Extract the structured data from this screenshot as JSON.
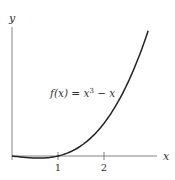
{
  "chart_data": {
    "type": "line",
    "title": "",
    "xlabel": "x",
    "ylabel": "y",
    "annotation": "f(x) = x³ − x",
    "xticks": [
      "1",
      "2"
    ],
    "xlim": [
      0,
      3.1
    ],
    "ylim": [
      -0.5,
      23
    ],
    "grid": false,
    "legend": "none",
    "series": [
      {
        "name": "f(x) = x^3 - x",
        "x": [
          0,
          0.25,
          0.5,
          0.577,
          0.75,
          1,
          1.25,
          1.5,
          1.75,
          2,
          2.25,
          2.5,
          2.75,
          2.96
        ],
        "values": [
          0,
          -0.23,
          -0.38,
          -0.38,
          -0.33,
          0,
          0.7,
          1.88,
          3.61,
          6.0,
          9.14,
          13.13,
          18.05,
          22.97
        ]
      }
    ]
  },
  "labels": {
    "x_axis": "x",
    "y_axis": "y",
    "tick_1": "1",
    "tick_2": "2",
    "fn_f": "f",
    "fn_rest": "(x) = x",
    "fn_exp": "3",
    "fn_tail": " − x"
  }
}
